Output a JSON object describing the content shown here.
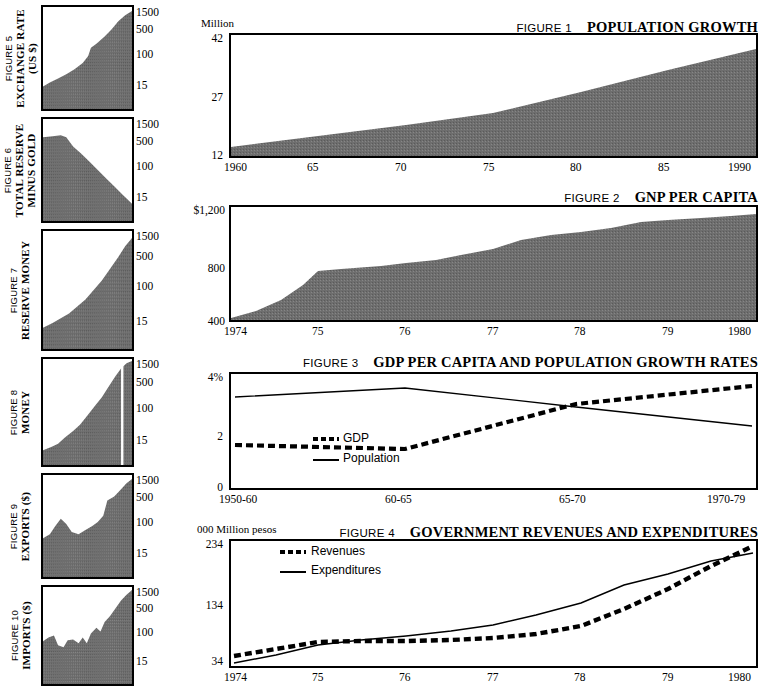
{
  "document": {
    "type": "statistical-figure-sheet",
    "fill_color": "#6e6e6e"
  },
  "side_panels": [
    {
      "figure": "FIGURE 5",
      "title": "EXCHANGE RATE (US $)",
      "title_lines": [
        "EXCHANGE RATE",
        "(US $)"
      ],
      "ticks": [
        "1500",
        "500",
        "100",
        "15"
      ],
      "shape": "rising-convex"
    },
    {
      "figure": "FIGURE 6",
      "title": "TOTAL RESERVE MINUS GOLD",
      "title_lines": [
        "TOTAL RESERVE",
        "MINUS GOLD"
      ],
      "ticks": [
        "1500",
        "500",
        "100",
        "15"
      ],
      "shape": "declining"
    },
    {
      "figure": "FIGURE 7",
      "title": "RESERVE MONEY",
      "title_lines": [
        "RESERVE MONEY"
      ],
      "ticks": [
        "1500",
        "500",
        "100",
        "15"
      ],
      "shape": "rising-steady"
    },
    {
      "figure": "FIGURE 8",
      "title": "MONEY",
      "title_lines": [
        "MONEY"
      ],
      "ticks": [
        "1500",
        "500",
        "100",
        "15"
      ],
      "shape": "rising-with-gap"
    },
    {
      "figure": "FIGURE 9",
      "title": "EXPORTS ($)",
      "title_lines": [
        "EXPORTS ($)"
      ],
      "ticks": [
        "1500",
        "500",
        "100",
        "15"
      ],
      "shape": "bumpy-rising"
    },
    {
      "figure": "FIGURE 10",
      "title": "IMPORTS ($)",
      "title_lines": [
        "IMPORTS ($)"
      ],
      "ticks": [
        "1500",
        "500",
        "100",
        "15"
      ],
      "shape": "jagged-rising"
    }
  ],
  "figures": {
    "fig1": {
      "figure_label": "FIGURE 1",
      "title": "POPULATION GROWTH",
      "unit": "Million",
      "yticks": [
        "42",
        "27",
        "12"
      ],
      "xticks": [
        "1960",
        "65",
        "70",
        "75",
        "80",
        "85",
        "1990"
      ]
    },
    "fig2": {
      "figure_label": "FIGURE 2",
      "title": "GNP PER CAPITA",
      "unit": "",
      "yticks": [
        "$1,200",
        "800",
        "400"
      ],
      "xticks": [
        "1974",
        "75",
        "76",
        "77",
        "78",
        "79",
        "1980"
      ]
    },
    "fig3": {
      "figure_label": "FIGURE 3",
      "title": "GDP PER CAPITA AND POPULATION GROWTH RATES",
      "unit": "",
      "yticks": [
        "4%",
        "2",
        "0"
      ],
      "xticks": [
        "1950-60",
        "60-65",
        "65-70",
        "1970-79"
      ],
      "legend": [
        {
          "name": "GDP",
          "style": "dashed"
        },
        {
          "name": "Population",
          "style": "solid"
        }
      ]
    },
    "fig4": {
      "figure_label": "FIGURE 4",
      "title": "GOVERNMENT REVENUES AND EXPENDITURES",
      "unit": "000 Million pesos",
      "yticks": [
        "234",
        "134",
        "34"
      ],
      "xticks": [
        "1974",
        "75",
        "76",
        "77",
        "78",
        "79",
        "1980"
      ],
      "legend": [
        {
          "name": "Revenues",
          "style": "dashed"
        },
        {
          "name": "Expenditures",
          "style": "solid"
        }
      ]
    }
  },
  "chart_data": [
    {
      "id": "fig1",
      "type": "area",
      "title": "POPULATION GROWTH",
      "xlabel": "",
      "ylabel": "Million",
      "ylim": [
        12,
        42
      ],
      "xlim": [
        1960,
        1990
      ],
      "grid": false,
      "x": [
        1960,
        1965,
        1970,
        1975,
        1980,
        1985,
        1990
      ],
      "values": [
        14.2,
        16.1,
        18.6,
        21.5,
        25.6,
        29.7,
        34.0
      ],
      "series": [
        {
          "name": "Population",
          "values": [
            14.2,
            16.1,
            18.6,
            21.5,
            25.6,
            29.7,
            34.0
          ]
        }
      ]
    },
    {
      "id": "fig2",
      "type": "area",
      "title": "GNP PER CAPITA",
      "xlabel": "",
      "ylabel": "$",
      "ylim": [
        400,
        1200
      ],
      "xlim": [
        1974,
        1980
      ],
      "grid": false,
      "x": [
        1974,
        1975,
        1976,
        1977,
        1978,
        1979,
        1980
      ],
      "values": [
        410,
        610,
        660,
        700,
        830,
        960,
        1090
      ],
      "series": [
        {
          "name": "GNP per capita",
          "values": [
            410,
            610,
            660,
            700,
            830,
            960,
            1090
          ]
        }
      ]
    },
    {
      "id": "fig3",
      "type": "line",
      "title": "GDP PER CAPITA AND POPULATION GROWTH RATES",
      "xlabel": "",
      "ylabel": "%",
      "ylim": [
        0,
        4
      ],
      "grid": false,
      "legend_position": "inside-left",
      "categories": [
        "1950-60",
        "60-65",
        "65-70",
        "1970-79"
      ],
      "series": [
        {
          "name": "GDP",
          "style": "dashed",
          "values": [
            1.5,
            1.3,
            2.9,
            3.7
          ]
        },
        {
          "name": "Population",
          "style": "solid",
          "values": [
            3.2,
            3.5,
            2.85,
            2.15
          ]
        }
      ]
    },
    {
      "id": "fig4",
      "type": "line",
      "title": "GOVERNMENT REVENUES AND EXPENDITURES",
      "xlabel": "",
      "ylabel": "000 Million pesos",
      "ylim": [
        34,
        234
      ],
      "xlim": [
        1974,
        1980
      ],
      "grid": false,
      "legend_position": "inside-left",
      "x": [
        1974,
        1975,
        1976,
        1977,
        1978,
        1979,
        1980
      ],
      "series": [
        {
          "name": "Revenues",
          "style": "dashed",
          "values": [
            46,
            62,
            60,
            66,
            84,
            118,
            228
          ]
        },
        {
          "name": "Expenditures",
          "style": "solid",
          "values": [
            36,
            54,
            62,
            74,
            104,
            142,
            212
          ]
        }
      ]
    }
  ]
}
